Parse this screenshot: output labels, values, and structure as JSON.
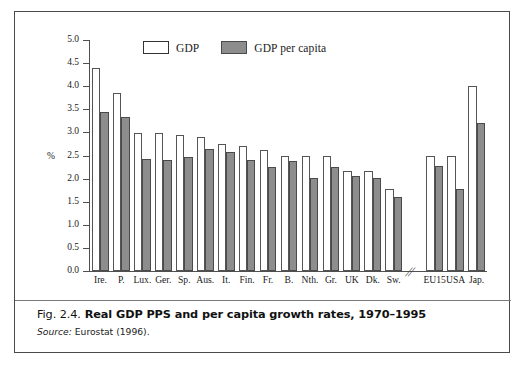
{
  "figure": {
    "caption_number": "Fig. 2.4.",
    "caption_title": "Real GDP PPS and per capita growth rates, 1970–1995",
    "source_word": "Source:",
    "source_text": "Eurostat (1996).",
    "axis_break_glyph": "//"
  },
  "legend": {
    "position": "top-center",
    "entries": [
      {
        "label": "GDP",
        "style": "open",
        "color": "#ffffff"
      },
      {
        "label": "GDP per capita",
        "style": "filled",
        "color": "#8d8d8d"
      }
    ]
  },
  "chart_data": {
    "type": "bar",
    "title": "Real GDP PPS and per capita growth rates, 1970–1995",
    "xlabel": "",
    "ylabel": "%",
    "ylim": [
      0.0,
      5.0
    ],
    "ytick_step": 0.5,
    "yticks": [
      "0.0",
      "0.5",
      "1.0",
      "1.5",
      "2.0",
      "2.5",
      "3.0",
      "3.5",
      "4.0",
      "4.5",
      "5.0"
    ],
    "grid": false,
    "legend_position": "top-center",
    "axis_break_after_category": "Sw.",
    "categories": [
      "Ire.",
      "P.",
      "Lux.",
      "Ger.",
      "Sp.",
      "Aus.",
      "It.",
      "Fin.",
      "Fr.",
      "B.",
      "Nth.",
      "Gr.",
      "UK",
      "Dk.",
      "Sw.",
      "EU15",
      "USA",
      "Jap."
    ],
    "series": [
      {
        "name": "GDP",
        "color": "#ffffff",
        "values": [
          4.4,
          3.85,
          2.98,
          2.98,
          2.94,
          2.89,
          2.75,
          2.7,
          2.62,
          2.5,
          2.48,
          2.48,
          2.16,
          2.16,
          1.78,
          2.5,
          2.5,
          4.0
        ]
      },
      {
        "name": "GDP per capita",
        "color": "#8d8d8d",
        "values": [
          3.45,
          3.34,
          2.42,
          2.4,
          2.47,
          2.65,
          2.57,
          2.4,
          2.26,
          2.38,
          2.02,
          2.26,
          2.05,
          2.02,
          1.6,
          2.27,
          1.78,
          3.2
        ]
      }
    ]
  }
}
